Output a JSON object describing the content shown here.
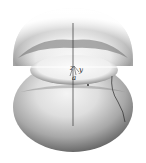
{
  "figure": {
    "labels": {
      "z_axis": "z",
      "y_axis": "y",
      "angle": "a"
    },
    "colors": {
      "background": "#ffffff",
      "surface_light": "#f2f2f2",
      "surface_mid": "#b5b5b5",
      "surface_dark": "#5a5a5a",
      "axis_line": "#333333",
      "curve": "#2a2a2a"
    }
  }
}
